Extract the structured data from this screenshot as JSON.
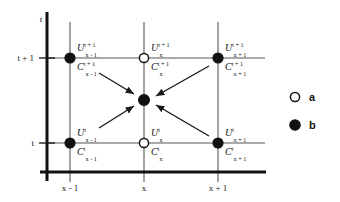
{
  "figure": {
    "type": "stencil-diagram",
    "background_color": "#ffffff",
    "axes": {
      "vertical_axis_label": "t",
      "horizontal_axis_label": "",
      "axis_color": "#111111",
      "grid_color": "#8c8c8c",
      "y_ticks": [
        {
          "label": "t + 1",
          "y": 58
        },
        {
          "label": "t",
          "y": 143
        }
      ],
      "x_ticks": [
        {
          "label": "x - 1",
          "x": 70
        },
        {
          "label": "x",
          "x": 144
        },
        {
          "label": "x + 1",
          "x": 218
        }
      ]
    },
    "nodes": [
      {
        "id": "node-xm1-tp1",
        "x": 70,
        "y": 58,
        "marker": "b",
        "filled": true,
        "labels": {
          "u": {
            "base": "U",
            "sup": "t + 1",
            "sub": "x - 1"
          },
          "c": {
            "base": "C",
            "sup": "t + 1",
            "sub": "x - 1"
          }
        }
      },
      {
        "id": "node-x-tp1",
        "x": 144,
        "y": 58,
        "marker": "a",
        "filled": false,
        "labels": {
          "u": {
            "base": "U",
            "sup": "t + 1",
            "sub": "x"
          },
          "c": {
            "base": "C",
            "sup": "t + 1",
            "sub": "x"
          }
        }
      },
      {
        "id": "node-xp1-tp1",
        "x": 218,
        "y": 58,
        "marker": "b",
        "filled": true,
        "labels": {
          "u": {
            "base": "U",
            "sup": "t + 1",
            "sub": "x + 1"
          },
          "c": {
            "base": "C",
            "sup": "t + 1",
            "sub": "x + 1"
          }
        }
      },
      {
        "id": "node-xm1-t",
        "x": 70,
        "y": 143,
        "marker": "b",
        "filled": true,
        "labels": {
          "u": {
            "base": "U",
            "sup": "t",
            "sub": "x - 1"
          },
          "c": {
            "base": "C",
            "sup": "t",
            "sub": "x - 1"
          }
        }
      },
      {
        "id": "node-x-t",
        "x": 144,
        "y": 143,
        "marker": "a",
        "filled": false,
        "labels": {
          "u": {
            "base": "U",
            "sup": "t",
            "sub": "x"
          },
          "c": {
            "base": "C",
            "sup": "t",
            "sub": "x"
          }
        }
      },
      {
        "id": "node-xp1-t",
        "x": 218,
        "y": 143,
        "marker": "b",
        "filled": true,
        "labels": {
          "u": {
            "base": "U",
            "sup": "t",
            "sub": "x + 1"
          },
          "c": {
            "base": "C",
            "sup": "t",
            "sub": "x + 1"
          }
        }
      }
    ],
    "center_node": {
      "id": "node-center",
      "x": 144,
      "y": 100,
      "marker": "b",
      "filled": true
    },
    "arrows": [
      {
        "id": "arrow-from-top-left",
        "x1": 99,
        "y1": 73,
        "x2": 134,
        "y2": 94
      },
      {
        "id": "arrow-from-bottom-left",
        "x1": 99,
        "y1": 128,
        "x2": 134,
        "y2": 106
      },
      {
        "id": "arrow-from-top-right",
        "x1": 209,
        "y1": 66,
        "x2": 155,
        "y2": 96
      },
      {
        "id": "arrow-from-bottom-right",
        "x1": 209,
        "y1": 136,
        "x2": 155,
        "y2": 105
      }
    ],
    "legend": {
      "items": [
        {
          "id": "legend-a",
          "label": "a",
          "marker": "open-circle",
          "filled": false,
          "x": 295,
          "y": 97
        },
        {
          "id": "legend-b",
          "label": "b",
          "marker": "filled-circle",
          "filled": true,
          "x": 295,
          "y": 125
        }
      ]
    },
    "colors": {
      "node_fill": "#111111",
      "node_stroke": "#111111",
      "open_fill": "#ffffff",
      "arrow": "#1a1a1a",
      "axis": "#111111",
      "grid": "#8c8c8c",
      "text": "#111111"
    }
  }
}
